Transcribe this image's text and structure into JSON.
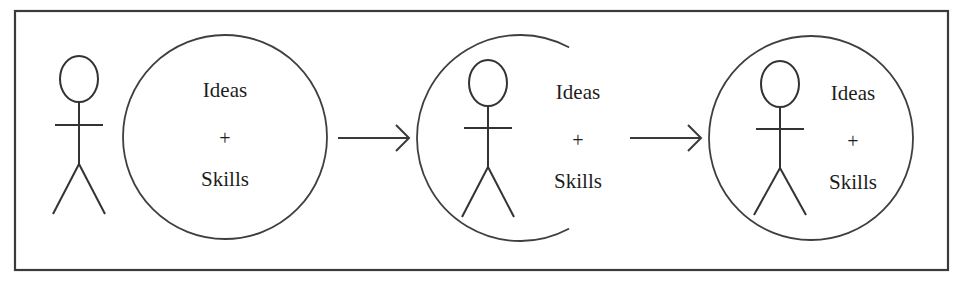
{
  "figure": {
    "title": "",
    "background_color": "#ffffff",
    "frame": {
      "name": "outer-border",
      "x": 15,
      "y": 11,
      "width": 933,
      "height": 259,
      "stroke_color": "#3a3a3a"
    },
    "stroke_color": "#3f3f3f",
    "text_color": "#1d1d1d"
  },
  "stages": [
    {
      "id": "stage-1",
      "name": "person-outside-circle",
      "circle": {
        "kind": "closed-circle",
        "cx": 225,
        "cy": 137,
        "r": 102
      },
      "person": {
        "cx": 79,
        "head_cy": 79,
        "head_rx": 19,
        "head_ry": 23,
        "neck_y": 102,
        "arms_y": 125,
        "arm_half_width": 24,
        "hip_y": 164,
        "leg_spread": 26,
        "feet_y": 214,
        "position": "outside"
      },
      "labels": {
        "cx": 225,
        "line1": "Ideas",
        "line2": "+",
        "line3": "Skills",
        "line1_y": 97,
        "line2_y": 145,
        "line3_y": 186
      }
    },
    {
      "id": "stage-2",
      "name": "person-entering-open-circle",
      "circle": {
        "kind": "open-arc",
        "cx": 520,
        "cy": 138,
        "r": 103,
        "start_angle_deg": 62,
        "end_angle_deg": 298,
        "gap_side": "right"
      },
      "person": {
        "cx": 488,
        "head_cy": 83,
        "head_rx": 19,
        "head_ry": 23,
        "neck_y": 106,
        "arms_y": 128,
        "arm_half_width": 24,
        "hip_y": 167,
        "leg_spread": 26,
        "feet_y": 217,
        "position": "straddling"
      },
      "labels": {
        "cx": 578,
        "line1": "Ideas",
        "line2": "+",
        "line3": "Skills",
        "line1_y": 99,
        "line2_y": 147,
        "line3_y": 188
      }
    },
    {
      "id": "stage-3",
      "name": "person-inside-circle",
      "circle": {
        "kind": "closed-circle",
        "cx": 811,
        "cy": 138,
        "r": 102
      },
      "person": {
        "cx": 780,
        "head_cy": 84,
        "head_rx": 19,
        "head_ry": 23,
        "neck_y": 107,
        "arms_y": 129,
        "arm_half_width": 24,
        "hip_y": 168,
        "leg_spread": 26,
        "feet_y": 215,
        "position": "inside"
      },
      "labels": {
        "cx": 853,
        "line1": "Ideas",
        "line2": "+",
        "line3": "Skills",
        "line1_y": 100,
        "line2_y": 148,
        "line3_y": 189
      }
    }
  ],
  "arrows": [
    {
      "id": "arrow-1",
      "name": "arrow-stage1-to-stage2",
      "x1": 338,
      "x2": 409,
      "y": 138,
      "head_size": 13
    },
    {
      "id": "arrow-2",
      "name": "arrow-stage2-to-stage3",
      "x1": 630,
      "x2": 701,
      "y": 138,
      "head_size": 13
    }
  ]
}
